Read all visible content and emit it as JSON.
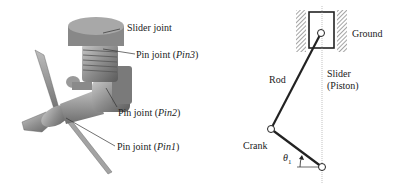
{
  "left_figure": {
    "description": "3D engine model with propeller",
    "labels": {
      "slider_joint": "Slider joint",
      "pin3_prefix": "Pin joint (",
      "pin3_name": "Pin3",
      "pin2_prefix": "Pin joint (",
      "pin2_name": "Pin2",
      "pin1_prefix": "Pin joint (",
      "pin1_name": "Pin1",
      "suffix": ")"
    }
  },
  "right_figure": {
    "description": "Slider-crank mechanism schematic",
    "labels": {
      "ground": "Ground",
      "rod": "Rod",
      "slider_line1": "Slider",
      "slider_line2": "(Piston)",
      "crank": "Crank",
      "theta_symbol": "θ",
      "theta_sub": "1"
    }
  }
}
